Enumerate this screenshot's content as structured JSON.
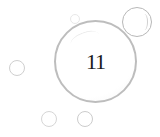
{
  "main_bubble": {
    "label": "11"
  },
  "colors": {
    "background": "#ffffff",
    "bubble_outline": "#bdbdbd",
    "text": "#1a1a1a"
  },
  "decor": {
    "bubbles": [
      {
        "name": "top-right-bubble"
      },
      {
        "name": "top-small-bubble"
      },
      {
        "name": "left-bubble"
      },
      {
        "name": "bottom-left-bubble"
      },
      {
        "name": "bottom-right-bubble"
      }
    ]
  }
}
